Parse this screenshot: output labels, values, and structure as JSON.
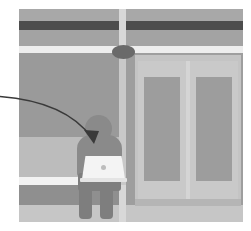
{
  "image": {
    "title": "Person using a laptop while seated on a subway platform bench",
    "width": 251,
    "height": 231,
    "style": "grayscale flat illustration",
    "background_color": "#ffffff"
  },
  "scene": {
    "frame": {
      "x": 19,
      "y": 9,
      "width": 224,
      "height": 213,
      "base_color": "#9b9b9b"
    },
    "bands": [
      {
        "name": "upper-wall",
        "top": 0,
        "height": 12,
        "color": "#a8a8a8"
      },
      {
        "name": "dark-stripe",
        "top": 12,
        "height": 9,
        "color": "#4d4d4d"
      },
      {
        "name": "mid-wall",
        "top": 21,
        "height": 16,
        "color": "#a3a3a3"
      },
      {
        "name": "light-rail",
        "top": 37,
        "height": 7,
        "color": "#ededed"
      },
      {
        "name": "main-wall",
        "top": 44,
        "height": 84,
        "color": "#9a9a9a"
      },
      {
        "name": "bench",
        "top": 128,
        "height": 40,
        "color": "#bcbcbc"
      },
      {
        "name": "bench-edge",
        "top": 168,
        "height": 8,
        "color": "#f2f2f2"
      },
      {
        "name": "floor-dark",
        "top": 176,
        "height": 20,
        "color": "#8f8f8f"
      },
      {
        "name": "floor-light",
        "top": 196,
        "height": 17,
        "color": "#c6c6c6"
      }
    ],
    "pillar": {
      "color": "#d8d8d8",
      "lower_color": "#c9c9c9",
      "hub_color": "#6a6a6a"
    },
    "doors": {
      "count": 2,
      "wall_color": "#9e9e9e",
      "frame_color": "#c4c4c4",
      "leaf_color": "#c9c9c9",
      "pane_color": "#9d9d9d",
      "split_color": "#d5d5d5",
      "threshold_color": "#b5b5b5"
    },
    "person": {
      "pose": "seated",
      "head_color": "#8a8a8a",
      "torso_color": "#8a8a8a",
      "legs_color": "#7e7e7e"
    },
    "laptop": {
      "lid_color": "#f4f4f4",
      "base_color": "#e4e4e4",
      "logo_color": "#bdbdbd"
    },
    "annotation_arrow": {
      "color": "#3a3a3a",
      "stroke_width": 1.4,
      "path": "M -6 97 C 40 99, 78 112, 96 140",
      "points_at": "person-torso",
      "head_color": "#3a3a3a"
    }
  }
}
